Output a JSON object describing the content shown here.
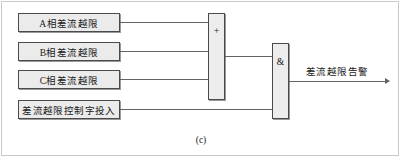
{
  "figure": {
    "caption": "(c)",
    "output": {
      "label": "差流越限告警",
      "arrow_icon": "arrow-right-icon"
    }
  },
  "inputs": [
    {
      "label": "A相差流越限",
      "target": "or-gate"
    },
    {
      "label": "B相差流越限",
      "target": "or-gate"
    },
    {
      "label": "C相差流越限",
      "target": "or-gate"
    },
    {
      "label": "差流越限控制字投入",
      "target": "and-gate"
    }
  ],
  "gates": [
    {
      "id": "or-gate",
      "symbol": "+",
      "type": "OR",
      "inputs": 3,
      "outputs": 1
    },
    {
      "id": "and-gate",
      "symbol": "&",
      "type": "AND",
      "inputs": 2,
      "outputs": 1
    }
  ],
  "colors": {
    "box_fill": "#ebebeb",
    "box_border": "#4a4a4a",
    "gate_fill": "#ededed",
    "wire": "#636363",
    "frame": "#c9c9c9",
    "text": "#1a1a1a",
    "background": "#ffffff"
  }
}
